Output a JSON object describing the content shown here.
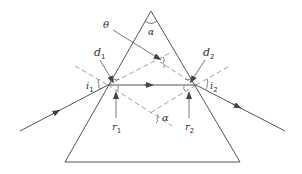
{
  "diagram": {
    "colors": {
      "line": "#555555",
      "dashed": "#888888",
      "text": "#333333",
      "background": "#ffffff"
    },
    "labels": {
      "apex_angle": "α",
      "theta": "θ",
      "d1": "d",
      "d1_sub": "1",
      "d2": "d",
      "d2_sub": "2",
      "i1": "i",
      "i1_sub": "1",
      "i2": "i",
      "i2_sub": "2",
      "r1": "r",
      "r1_sub": "1",
      "r2": "r",
      "r2_sub": "2",
      "normals_angle": "α"
    },
    "elements": [
      {
        "name": "prism",
        "shape": "triangle"
      },
      {
        "name": "incident-ray",
        "direction": "into prism"
      },
      {
        "name": "refracted-ray",
        "direction": "horizontal inside prism"
      },
      {
        "name": "emergent-ray",
        "direction": "out of prism"
      },
      {
        "name": "normal-1",
        "style": "dashed"
      },
      {
        "name": "normal-2",
        "style": "dashed"
      }
    ]
  }
}
